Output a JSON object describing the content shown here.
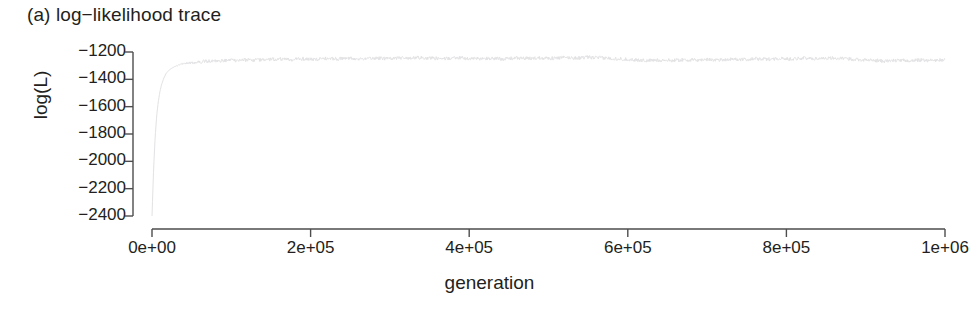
{
  "figure": {
    "panel_title": "(a) log−likelihood trace",
    "background_color": "#ffffff",
    "axis_color": "#4d4d4d",
    "text_color": "#231f20",
    "trace_color": "#e2e2e4"
  },
  "chart_data": {
    "type": "line",
    "title": "(a) log−likelihood trace",
    "xlabel": "generation",
    "ylabel": "log(L)",
    "xlim": [
      0,
      1000000
    ],
    "ylim": [
      -2400,
      -1200
    ],
    "grid": false,
    "legend": null,
    "xtick_labels": [
      "0e+00",
      "2e+05",
      "4e+05",
      "6e+05",
      "8e+05",
      "1e+06"
    ],
    "xtick_values": [
      0,
      200000,
      400000,
      600000,
      800000,
      1000000
    ],
    "ytick_labels": [
      "−1200",
      "−1400",
      "−1600",
      "−1800",
      "−2000",
      "−2200",
      "−2400"
    ],
    "ytick_values": [
      -1200,
      -1400,
      -1600,
      -1800,
      -2000,
      -2200,
      -2400
    ],
    "series": [
      {
        "name": "log-likelihood",
        "x": [
          0,
          2000,
          4000,
          6000,
          8000,
          10000,
          12000,
          15000,
          18000,
          22000,
          26000,
          30000,
          35000,
          40000,
          45000,
          50000,
          60000,
          70000,
          80000,
          90000,
          100000,
          115000,
          130000,
          145000,
          160000,
          175000,
          190000,
          205000,
          220000,
          235000,
          250000,
          265000,
          280000,
          295000,
          310000,
          325000,
          340000,
          355000,
          370000,
          385000,
          400000,
          415000,
          430000,
          445000,
          460000,
          475000,
          490000,
          505000,
          520000,
          535000,
          550000,
          565000,
          580000,
          595000,
          610000,
          625000,
          640000,
          655000,
          670000,
          685000,
          700000,
          715000,
          730000,
          745000,
          760000,
          775000,
          790000,
          805000,
          820000,
          835000,
          850000,
          865000,
          880000,
          895000,
          910000,
          925000,
          940000,
          955000,
          970000,
          985000,
          1000000
        ],
        "y": [
          -2400,
          -2060,
          -1820,
          -1660,
          -1560,
          -1490,
          -1440,
          -1390,
          -1355,
          -1330,
          -1315,
          -1303,
          -1292,
          -1286,
          -1281,
          -1278,
          -1272,
          -1268,
          -1266,
          -1263,
          -1262,
          -1258,
          -1259,
          -1255,
          -1252,
          -1257,
          -1250,
          -1254,
          -1248,
          -1251,
          -1246,
          -1249,
          -1244,
          -1247,
          -1243,
          -1246,
          -1241,
          -1245,
          -1249,
          -1243,
          -1247,
          -1251,
          -1246,
          -1250,
          -1244,
          -1248,
          -1242,
          -1246,
          -1241,
          -1244,
          -1239,
          -1243,
          -1247,
          -1252,
          -1258,
          -1263,
          -1259,
          -1262,
          -1257,
          -1260,
          -1255,
          -1258,
          -1252,
          -1256,
          -1250,
          -1253,
          -1248,
          -1251,
          -1245,
          -1249,
          -1243,
          -1247,
          -1251,
          -1256,
          -1262,
          -1266,
          -1261,
          -1264,
          -1259,
          -1262,
          -1258
        ]
      }
    ]
  }
}
